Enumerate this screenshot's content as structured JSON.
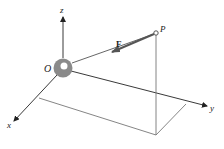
{
  "diagram": {
    "labels": {
      "z_axis": "z",
      "x_axis": "x",
      "y_axis": "y",
      "origin": "O",
      "point": "P",
      "force": "F"
    },
    "colors": {
      "axis": "#333333",
      "guide": "#777777",
      "force": "#555555",
      "sphere": "#8a8a8a",
      "sphere_highlight": "#ffffff",
      "background": "#ffffff"
    }
  }
}
